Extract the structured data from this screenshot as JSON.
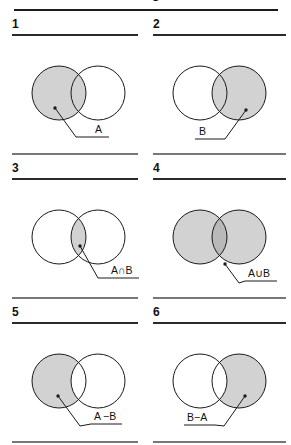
{
  "figure": {
    "caption": "Venn diagrams",
    "colors": {
      "fill": "#d2d2d2",
      "fill_dark": "#b9b9b9",
      "stroke": "#1a1a1a",
      "rule_dark": "#2a2a2a",
      "rule_light": "#777777",
      "background": "#ffffff",
      "text": "#111111"
    }
  },
  "panels": [
    {
      "number": "1",
      "label": "A",
      "shaded_region": "set-a",
      "description": "Left circle shaded: set A",
      "label_side": "right",
      "dot": {
        "x": 43,
        "y": 70
      },
      "elbow": {
        "x": 64,
        "y": 99
      },
      "label_pos": {
        "x": 83,
        "y": 95
      },
      "underline": {
        "x1": 78,
        "x2": 97,
        "y": 99
      }
    },
    {
      "number": "2",
      "label": "B",
      "shaded_region": "set-b",
      "description": "Right circle shaded: set B",
      "label_side": "left",
      "dot": {
        "x": 93,
        "y": 72
      },
      "elbow": {
        "x": 72,
        "y": 101
      },
      "label_pos": {
        "x": 46,
        "y": 97
      },
      "underline": {
        "x1": 42,
        "x2": 61,
        "y": 101
      }
    },
    {
      "number": "3",
      "label": "A∩B",
      "shaded_region": "intersection",
      "description": "Lens of overlap shaded: A intersect B",
      "label_side": "right",
      "dot": {
        "x": 68,
        "y": 64
      },
      "elbow": {
        "x": 86,
        "y": 96
      },
      "label_pos": {
        "x": 99,
        "y": 92
      },
      "underline": {
        "x1": 96,
        "x2": 127,
        "y": 96
      }
    },
    {
      "number": "4",
      "label": "A∪B",
      "shaded_region": "union",
      "description": "Both circles shaded with darker overlap: A union B",
      "label_side": "right",
      "dot": {
        "x": 72,
        "y": 82
      },
      "elbow": {
        "x": 86,
        "y": 101
      },
      "label_pos": {
        "x": 95,
        "y": 95
      },
      "underline": {
        "x1": 92,
        "x2": 124,
        "y": 99
      }
    },
    {
      "number": "5",
      "label": "A −B",
      "shaded_region": "a-minus-b",
      "description": "Left circle minus overlap shaded: A minus B",
      "label_side": "right",
      "dot": {
        "x": 46,
        "y": 70
      },
      "elbow": {
        "x": 68,
        "y": 100
      },
      "label_pos": {
        "x": 82,
        "y": 94
      },
      "underline": {
        "x1": 79,
        "x2": 110,
        "y": 98
      }
    },
    {
      "number": "6",
      "label": "B−A",
      "shaded_region": "b-minus-a",
      "description": "Right circle minus overlap shaded: B minus A",
      "label_side": "left",
      "dot": {
        "x": 92,
        "y": 70
      },
      "elbow": {
        "x": 71,
        "y": 100
      },
      "label_pos": {
        "x": 34,
        "y": 95
      },
      "underline": {
        "x1": 31,
        "x2": 62,
        "y": 99
      }
    }
  ],
  "geometry": {
    "circle_a": {
      "cx": 47,
      "cy": 55,
      "r": 27
    },
    "circle_b": {
      "cx": 86,
      "cy": 55,
      "r": 27
    }
  }
}
